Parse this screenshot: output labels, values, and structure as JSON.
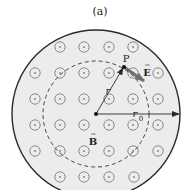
{
  "figure": {
    "panel_label": "(a)",
    "labels": {
      "point": "P",
      "radius": "r",
      "outer_radius": "r",
      "outer_radius_sub": "0",
      "electric_field": "E",
      "magnetic_field": "B",
      "vector_arrow": "→"
    },
    "colors": {
      "region_fill": "#ececec",
      "outline": "#2a2a2a",
      "symbol": "#8a8a8a",
      "dashed_circle": "#333333",
      "field_arrow": "#7a7a7a"
    },
    "geometry": {
      "center": [
        96,
        114
      ],
      "outer_radius_px": 84,
      "dashed_radius_px": 53,
      "point_P": [
        124,
        67
      ],
      "e_arrow_end": [
        144,
        81
      ]
    },
    "field_symbols": {
      "kind": "dot-in-circle (field out of page)",
      "rows": [
        {
          "y": 47,
          "xs": [
            60,
            84,
            109,
            133
          ]
        },
        {
          "y": 73,
          "xs": [
            35,
            60,
            84,
            109,
            133,
            158
          ]
        },
        {
          "y": 99,
          "xs": [
            35,
            60,
            84,
            109,
            133,
            158
          ]
        },
        {
          "y": 125,
          "xs": [
            35,
            60,
            84,
            109,
            133,
            158
          ]
        },
        {
          "y": 151,
          "xs": [
            35,
            60,
            84,
            109,
            133,
            158
          ]
        },
        {
          "y": 177,
          "xs": [
            60,
            84,
            109,
            134
          ]
        }
      ]
    }
  }
}
